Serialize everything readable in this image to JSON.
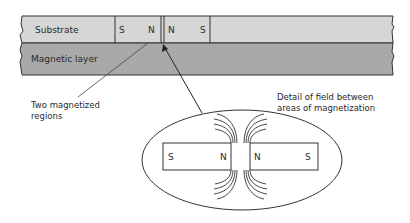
{
  "diagram": {
    "layers": {
      "substrate": {
        "label": "Substrate",
        "color": "#d6d6d6"
      },
      "magnetic_layer": {
        "label": "Magnetic layer",
        "color": "#a9a9a9"
      }
    },
    "regions": [
      {
        "left_pole": "S",
        "right_pole": "N"
      },
      {
        "left_pole": "N",
        "right_pole": "S"
      }
    ],
    "callouts": {
      "regions_label_line1": "Two magnetized",
      "regions_label_line2": "regions",
      "detail_label_line1": "Detail of field between",
      "detail_label_line2": "areas of magnetization"
    },
    "detail": {
      "left_bar": {
        "left_pole": "S",
        "right_pole": "N"
      },
      "right_bar": {
        "left_pole": "N",
        "right_pole": "S"
      }
    }
  }
}
